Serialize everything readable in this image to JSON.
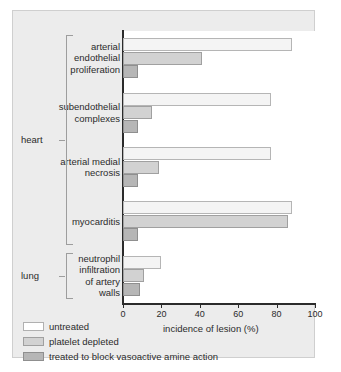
{
  "chart_data": {
    "type": "bar",
    "orientation": "horizontal",
    "title": "",
    "xlabel": "incidence of lesion (%)",
    "ylabel": "",
    "xlim": [
      0,
      100
    ],
    "xticks": [
      0,
      20,
      40,
      60,
      80,
      100
    ],
    "grid": false,
    "legend_position": "bottom-left",
    "categories": [
      "arterial endothelial proliferation",
      "subendothelial complexes",
      "arterial medial necrosis",
      "myocarditis",
      "neutrophil infiltration of artery walls"
    ],
    "category_lines": [
      [
        "arterial",
        "endothelial",
        "proliferation"
      ],
      [
        "subendothelial",
        "complexes"
      ],
      [
        "arterial medial",
        "necrosis"
      ],
      [
        "myocarditis"
      ],
      [
        "neutrophil",
        "infiltration",
        "of artery",
        "walls"
      ]
    ],
    "series": [
      {
        "name": "untreated",
        "color": "#f4f4f4",
        "values": [
          88,
          77,
          77,
          88,
          20
        ]
      },
      {
        "name": "platelet depleted",
        "color": "#d2d2d2",
        "values": [
          41,
          15,
          19,
          86,
          11
        ]
      },
      {
        "name": "treated to block vasoactive amine action",
        "color": "#b6b6b6",
        "values": [
          8,
          8,
          8,
          8,
          9
        ]
      }
    ],
    "organ_groups": [
      {
        "label": "heart",
        "categories": [
          0,
          1,
          2,
          3
        ]
      },
      {
        "label": "lung",
        "categories": [
          4
        ]
      }
    ]
  },
  "legend": {
    "items": [
      {
        "label": "untreated"
      },
      {
        "label": "platelet depleted"
      },
      {
        "label": "treated to block vasoactive amine action"
      }
    ]
  },
  "axis": {
    "xlabel": "incidence of lesion (%)",
    "ticklabels": [
      "0",
      "20",
      "40",
      "60",
      "80",
      "100"
    ]
  }
}
